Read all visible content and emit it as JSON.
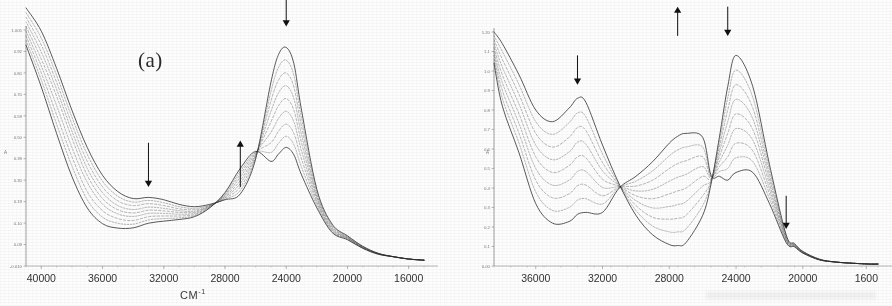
{
  "figure": {
    "kind": "uv-vis-spectral-titration",
    "background_color": "#fdfdfd",
    "ink_color": "#2b2b2b",
    "panel_count": 2
  },
  "panels": [
    {
      "id": "a",
      "label": "(a)",
      "xlabel": "CM",
      "xlabel_sup": "-1",
      "ylabel": "A",
      "xticks": [
        "40000",
        "36000",
        "32000",
        "28000",
        "24000",
        "20000",
        "16000"
      ],
      "yticks": [
        "1.005",
        "0.92",
        "0.80",
        "0.70",
        "0.59",
        "0.50",
        "0.39",
        "0.30",
        "0.19",
        "0.10",
        "0.09",
        "-0.010"
      ],
      "arrows": [
        {
          "name": "arrow-down-33000",
          "direction": "down",
          "x": 33000,
          "note": "band decreasing near 33000"
        },
        {
          "name": "arrow-up-27000",
          "direction": "up",
          "x": 27000,
          "note": "band increasing near 27000"
        },
        {
          "name": "arrow-down-24000",
          "direction": "down",
          "x": 24000,
          "note": "main band decreasing near 24000"
        }
      ]
    },
    {
      "id": "b",
      "label": "(b)",
      "xlabel": "cm",
      "xlabel_sup": "-1",
      "ylabel": "A",
      "xticks": [
        "36000",
        "32000",
        "28000",
        "24000",
        "20000",
        "1600"
      ],
      "yticks": [
        "1.20",
        "1.1",
        "1.0",
        "0.9",
        "0.8",
        "0.7",
        "0.6",
        "0.5",
        "0.4",
        "0.3",
        "0.2",
        "0.1",
        "0.00"
      ],
      "arrows": [
        {
          "name": "arrow-down-33500",
          "direction": "down",
          "x": 33500,
          "note": "band decreasing near 33500"
        },
        {
          "name": "arrow-up-27500",
          "direction": "up",
          "x": 27500,
          "note": "band increasing near 27500"
        },
        {
          "name": "arrow-down-24500",
          "direction": "down",
          "x": 24500,
          "note": "band decreasing near 24500"
        },
        {
          "name": "arrow-down-21000",
          "direction": "down",
          "x": 21000,
          "note": "weak band decreasing near 21000"
        }
      ]
    }
  ],
  "chart_data": [
    {
      "type": "line",
      "id": "panel-a",
      "title": "(a)",
      "xlabel": "CM-1",
      "ylabel": "A",
      "xlim": [
        41000,
        15000
      ],
      "ylim": [
        -0.01,
        1.005
      ],
      "x_axis_inverted": true,
      "grid": false,
      "legend": "none",
      "n_series": 9,
      "series_note": "Isosbestic family: the 24000 band falls and the 27000 shoulder rises with successive spectra.",
      "x": [
        41000,
        40000,
        39000,
        38000,
        37000,
        36000,
        35000,
        34000,
        33000,
        32000,
        31000,
        30000,
        29000,
        28000,
        27000,
        26000,
        25000,
        24500,
        24000,
        23500,
        23000,
        22000,
        21000,
        20000,
        19000,
        18000,
        17000,
        16000,
        15000
      ],
      "series": [
        {
          "name": "spectrum-1",
          "values": [
            1.1,
            1.0,
            0.84,
            0.66,
            0.5,
            0.38,
            0.31,
            0.28,
            0.285,
            0.275,
            0.255,
            0.245,
            0.255,
            0.275,
            0.3,
            0.45,
            0.78,
            0.9,
            0.93,
            0.86,
            0.66,
            0.32,
            0.17,
            0.12,
            0.075,
            0.045,
            0.03,
            0.02,
            0.015
          ]
        },
        {
          "name": "spectrum-2",
          "values": [
            1.08,
            0.97,
            0.81,
            0.63,
            0.47,
            0.355,
            0.29,
            0.265,
            0.272,
            0.262,
            0.245,
            0.238,
            0.252,
            0.278,
            0.315,
            0.455,
            0.74,
            0.845,
            0.875,
            0.81,
            0.625,
            0.31,
            0.165,
            0.117,
            0.073,
            0.044,
            0.03,
            0.02,
            0.015
          ]
        },
        {
          "name": "spectrum-3",
          "values": [
            1.06,
            0.94,
            0.78,
            0.6,
            0.44,
            0.33,
            0.27,
            0.25,
            0.258,
            0.25,
            0.236,
            0.232,
            0.25,
            0.282,
            0.33,
            0.46,
            0.7,
            0.79,
            0.82,
            0.76,
            0.59,
            0.3,
            0.16,
            0.115,
            0.072,
            0.044,
            0.03,
            0.02,
            0.015
          ]
        },
        {
          "name": "spectrum-4",
          "values": [
            1.04,
            0.91,
            0.75,
            0.57,
            0.41,
            0.305,
            0.25,
            0.233,
            0.243,
            0.238,
            0.228,
            0.226,
            0.248,
            0.286,
            0.345,
            0.465,
            0.655,
            0.735,
            0.765,
            0.71,
            0.555,
            0.29,
            0.155,
            0.113,
            0.071,
            0.043,
            0.03,
            0.02,
            0.015
          ]
        },
        {
          "name": "spectrum-5",
          "values": [
            1.02,
            0.88,
            0.72,
            0.54,
            0.38,
            0.28,
            0.232,
            0.218,
            0.23,
            0.227,
            0.221,
            0.221,
            0.247,
            0.29,
            0.358,
            0.47,
            0.61,
            0.68,
            0.71,
            0.66,
            0.52,
            0.28,
            0.15,
            0.111,
            0.07,
            0.043,
            0.03,
            0.02,
            0.015
          ]
        },
        {
          "name": "spectrum-6",
          "values": [
            1.0,
            0.85,
            0.68,
            0.5,
            0.35,
            0.256,
            0.214,
            0.203,
            0.216,
            0.216,
            0.213,
            0.216,
            0.245,
            0.294,
            0.372,
            0.475,
            0.565,
            0.625,
            0.655,
            0.61,
            0.485,
            0.27,
            0.146,
            0.109,
            0.069,
            0.042,
            0.03,
            0.02,
            0.015
          ]
        },
        {
          "name": "spectrum-7",
          "values": [
            0.98,
            0.82,
            0.64,
            0.46,
            0.31,
            0.228,
            0.194,
            0.186,
            0.202,
            0.205,
            0.205,
            0.211,
            0.243,
            0.298,
            0.385,
            0.478,
            0.52,
            0.57,
            0.6,
            0.56,
            0.45,
            0.26,
            0.142,
            0.107,
            0.068,
            0.042,
            0.03,
            0.02,
            0.015
          ]
        },
        {
          "name": "spectrum-8",
          "values": [
            0.96,
            0.79,
            0.6,
            0.42,
            0.275,
            0.2,
            0.174,
            0.17,
            0.188,
            0.194,
            0.197,
            0.206,
            0.241,
            0.302,
            0.397,
            0.48,
            0.478,
            0.518,
            0.548,
            0.512,
            0.415,
            0.25,
            0.138,
            0.105,
            0.067,
            0.041,
            0.03,
            0.02,
            0.015
          ]
        },
        {
          "name": "spectrum-9",
          "values": [
            0.94,
            0.76,
            0.56,
            0.375,
            0.24,
            0.172,
            0.153,
            0.154,
            0.174,
            0.183,
            0.19,
            0.202,
            0.24,
            0.306,
            0.41,
            0.483,
            0.44,
            0.472,
            0.5,
            0.468,
            0.382,
            0.24,
            0.134,
            0.103,
            0.066,
            0.041,
            0.03,
            0.02,
            0.015
          ]
        }
      ],
      "annotations": [
        {
          "text": "(a)",
          "x": 31000,
          "y": 0.9
        },
        {
          "text": "down-arrow",
          "x": 33000,
          "y": 0.45
        },
        {
          "text": "up-arrow",
          "x": 27000,
          "y": 0.52
        },
        {
          "text": "down-arrow",
          "x": 24000,
          "y": 1.0
        }
      ]
    },
    {
      "type": "line",
      "id": "panel-b",
      "title": "(b)",
      "xlabel": "cm-1",
      "ylabel": "A",
      "xlim": [
        38500,
        15500
      ],
      "ylim": [
        0.0,
        1.2
      ],
      "x_axis_inverted": true,
      "grid": false,
      "legend": "none",
      "n_series": 9,
      "series_note": "Two isosbestic points near 31000 and 25500; the 33500 and 24500 bands fall while the 27500 band rises.",
      "x": [
        38500,
        38000,
        37000,
        36000,
        35000,
        34000,
        33500,
        33000,
        32000,
        31000,
        30000,
        29000,
        28000,
        27500,
        27000,
        26000,
        25500,
        25000,
        24500,
        24000,
        23000,
        22000,
        21000,
        20500,
        20000,
        19000,
        18000,
        17000,
        16000,
        15500
      ],
      "series": [
        {
          "name": "spectrum-1",
          "values": [
            1.2,
            1.14,
            0.98,
            0.8,
            0.74,
            0.81,
            0.86,
            0.84,
            0.62,
            0.42,
            0.26,
            0.16,
            0.11,
            0.105,
            0.12,
            0.26,
            0.42,
            0.66,
            0.92,
            1.08,
            0.92,
            0.52,
            0.16,
            0.115,
            0.075,
            0.035,
            0.02,
            0.014,
            0.01,
            0.01
          ]
        },
        {
          "name": "spectrum-2",
          "values": [
            1.18,
            1.1,
            0.93,
            0.74,
            0.675,
            0.735,
            0.785,
            0.765,
            0.575,
            0.415,
            0.285,
            0.205,
            0.175,
            0.175,
            0.19,
            0.31,
            0.43,
            0.635,
            0.862,
            1.005,
            0.865,
            0.495,
            0.155,
            0.112,
            0.073,
            0.034,
            0.02,
            0.014,
            0.01,
            0.01
          ]
        },
        {
          "name": "spectrum-3",
          "values": [
            1.16,
            1.06,
            0.88,
            0.68,
            0.61,
            0.66,
            0.71,
            0.695,
            0.53,
            0.412,
            0.31,
            0.25,
            0.24,
            0.245,
            0.26,
            0.36,
            0.435,
            0.61,
            0.8,
            0.93,
            0.81,
            0.47,
            0.15,
            0.11,
            0.072,
            0.034,
            0.02,
            0.014,
            0.01,
            0.01
          ]
        },
        {
          "name": "spectrum-4",
          "values": [
            1.14,
            1.02,
            0.83,
            0.62,
            0.545,
            0.585,
            0.635,
            0.625,
            0.488,
            0.41,
            0.335,
            0.298,
            0.305,
            0.315,
            0.33,
            0.41,
            0.44,
            0.585,
            0.74,
            0.855,
            0.755,
            0.445,
            0.145,
            0.108,
            0.071,
            0.033,
            0.02,
            0.014,
            0.01,
            0.01
          ]
        },
        {
          "name": "spectrum-5",
          "values": [
            1.12,
            0.98,
            0.78,
            0.56,
            0.48,
            0.515,
            0.56,
            0.555,
            0.445,
            0.408,
            0.36,
            0.345,
            0.37,
            0.385,
            0.4,
            0.46,
            0.445,
            0.56,
            0.68,
            0.78,
            0.7,
            0.42,
            0.14,
            0.106,
            0.07,
            0.033,
            0.02,
            0.014,
            0.01,
            0.01
          ]
        },
        {
          "name": "spectrum-6",
          "values": [
            1.1,
            0.94,
            0.73,
            0.5,
            0.415,
            0.44,
            0.485,
            0.485,
            0.403,
            0.406,
            0.385,
            0.393,
            0.435,
            0.455,
            0.47,
            0.51,
            0.45,
            0.535,
            0.62,
            0.705,
            0.645,
            0.395,
            0.135,
            0.104,
            0.069,
            0.032,
            0.02,
            0.014,
            0.01,
            0.01
          ]
        },
        {
          "name": "spectrum-7",
          "values": [
            1.08,
            0.9,
            0.68,
            0.44,
            0.35,
            0.37,
            0.412,
            0.415,
            0.36,
            0.404,
            0.41,
            0.44,
            0.5,
            0.525,
            0.54,
            0.56,
            0.455,
            0.51,
            0.56,
            0.63,
            0.59,
            0.37,
            0.13,
            0.102,
            0.068,
            0.032,
            0.02,
            0.014,
            0.01,
            0.01
          ]
        },
        {
          "name": "spectrum-8",
          "values": [
            1.06,
            0.86,
            0.63,
            0.38,
            0.285,
            0.3,
            0.338,
            0.345,
            0.318,
            0.402,
            0.435,
            0.488,
            0.565,
            0.595,
            0.61,
            0.61,
            0.46,
            0.485,
            0.5,
            0.555,
            0.535,
            0.345,
            0.125,
            0.1,
            0.067,
            0.031,
            0.02,
            0.014,
            0.01,
            0.01
          ]
        },
        {
          "name": "spectrum-9",
          "values": [
            1.04,
            0.82,
            0.58,
            0.32,
            0.22,
            0.228,
            0.265,
            0.275,
            0.275,
            0.4,
            0.46,
            0.535,
            0.63,
            0.665,
            0.68,
            0.66,
            0.465,
            0.46,
            0.44,
            0.48,
            0.48,
            0.32,
            0.12,
            0.098,
            0.066,
            0.031,
            0.02,
            0.014,
            0.01,
            0.01
          ]
        }
      ],
      "annotations": [
        {
          "text": "(b)",
          "x": 29500,
          "y": 1.14
        },
        {
          "text": "down-arrow",
          "x": 33500,
          "y": 1.05
        },
        {
          "text": "up-arrow",
          "x": 27500,
          "y": 1.18
        },
        {
          "text": "down-arrow",
          "x": 24500,
          "y": 1.18
        },
        {
          "text": "down-arrow",
          "x": 21000,
          "y": 0.32
        }
      ]
    }
  ]
}
